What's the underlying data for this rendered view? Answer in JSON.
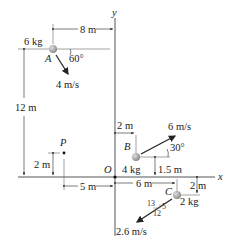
{
  "figure": {
    "axes": {
      "x_label": "x",
      "y_label": "y",
      "origin_label": "O"
    },
    "particles": {
      "A": {
        "label": "A",
        "mass": "6 kg",
        "speed": "4 m/s",
        "angle": "60°"
      },
      "B": {
        "label": "B",
        "mass": "4 kg",
        "speed": "6 m/s",
        "angle": "30°"
      },
      "C": {
        "label": "C",
        "mass": "2 kg",
        "speed": "2.6 m/s",
        "slope": {
          "hyp": "13",
          "rise": "5",
          "run": "12"
        }
      }
    },
    "point_P": {
      "label": "P"
    },
    "dimensions": {
      "a_x": "8 m",
      "a_y": "12 m",
      "p_y": "2 m",
      "p_x": "5 m",
      "b_x": "2 m",
      "b_y": "1.5 m",
      "c_x": "6 m",
      "c_y": "2 m"
    },
    "colors": {
      "line": "#222222",
      "ball": "#9a9a9a",
      "ball_highlight": "#d8d8d8"
    }
  }
}
